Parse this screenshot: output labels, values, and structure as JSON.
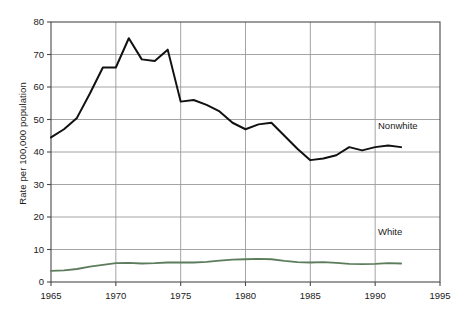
{
  "chart_data": {
    "type": "line",
    "title": "",
    "xlabel": "",
    "ylabel": "Rate per 100,000 population",
    "xlim": [
      1965,
      1995
    ],
    "ylim": [
      0,
      80
    ],
    "xticks": [
      1965,
      1970,
      1975,
      1980,
      1985,
      1990,
      1995
    ],
    "yticks": [
      0,
      10,
      20,
      30,
      40,
      50,
      60,
      70,
      80
    ],
    "grid": true,
    "legend_position": "inline-right",
    "x": [
      1965,
      1966,
      1967,
      1968,
      1969,
      1970,
      1971,
      1972,
      1973,
      1974,
      1975,
      1976,
      1977,
      1978,
      1979,
      1980,
      1981,
      1982,
      1983,
      1984,
      1985,
      1986,
      1987,
      1988,
      1989,
      1990,
      1991,
      1992
    ],
    "series": [
      {
        "name": "Nonwhite",
        "color": "#111111",
        "label": "Nonwhite",
        "values": [
          44.5,
          47.0,
          50.5,
          58.0,
          66.0,
          66.0,
          75.0,
          68.5,
          68.0,
          71.5,
          55.5,
          56.0,
          54.5,
          52.5,
          49.0,
          47.0,
          48.5,
          49.0,
          45.0,
          41.0,
          37.5,
          38.0,
          39.0,
          41.5,
          40.5,
          41.5,
          42.0,
          41.5
        ]
      },
      {
        "name": "White",
        "color": "#5c7d5c",
        "label": "White",
        "values": [
          3.4,
          3.6,
          4.0,
          4.7,
          5.3,
          5.8,
          5.9,
          5.7,
          5.8,
          6.0,
          6.0,
          6.0,
          6.2,
          6.6,
          6.9,
          7.0,
          7.1,
          7.0,
          6.5,
          6.1,
          6.0,
          6.1,
          5.9,
          5.6,
          5.5,
          5.6,
          5.8,
          5.7
        ]
      }
    ],
    "tick_labels": {
      "x": [
        "1965",
        "1970",
        "1975",
        "1980",
        "1985",
        "1990",
        "1995"
      ],
      "y": [
        "0",
        "10",
        "20",
        "30",
        "40",
        "50",
        "60",
        "70",
        "80"
      ]
    }
  },
  "axis_titles": {
    "y": "Rate per 100,000 population"
  },
  "colors": {
    "nonwhite": "#111111",
    "white": "#5c7d5c",
    "grid": "#9a9a9a",
    "frame": "#4a4a4a",
    "text": "#1a1a1a"
  }
}
